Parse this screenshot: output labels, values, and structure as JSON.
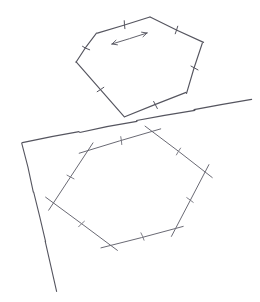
{
  "figure": {
    "title": "Hand-drawn geometry sketch",
    "background_color": "#ffffff",
    "ink_color": "#55555f",
    "ink_color_light": "#7a7a85",
    "canvas": {
      "width": 260,
      "height": 302
    }
  },
  "shapes": {
    "upper_hexagon": {
      "name": "upper-hexagon",
      "label": "",
      "stroke": "#55555f",
      "vertices": [
        [
          97,
          33
        ],
        [
          150,
          17
        ],
        [
          203,
          43
        ],
        [
          186,
          93
        ],
        [
          125,
          117
        ],
        [
          76,
          62
        ]
      ],
      "tick_marks": [
        {
          "edge_index": 0,
          "t": 0.52,
          "length": 8,
          "angle_offset": 12
        },
        {
          "edge_index": 1,
          "t": 0.5,
          "length": 8,
          "angle_offset": -8
        },
        {
          "edge_index": 2,
          "t": 0.5,
          "length": 8,
          "angle_offset": 10
        },
        {
          "edge_index": 3,
          "t": 0.5,
          "length": 8,
          "angle_offset": -6
        },
        {
          "edge_index": 4,
          "t": 0.5,
          "length": 8,
          "angle_offset": 8
        },
        {
          "edge_index": 5,
          "t": 0.48,
          "length": 8,
          "angle_offset": -10
        }
      ]
    },
    "lower_hexagon": {
      "name": "lower-hexagon",
      "label": "",
      "stroke": "#6a6a74",
      "overshoot": 9,
      "vertices": [
        [
          88,
          151
        ],
        [
          152,
          131
        ],
        [
          205,
          172
        ],
        [
          175,
          228
        ],
        [
          110,
          245
        ],
        [
          53,
          203
        ]
      ],
      "tick_marks": [
        {
          "edge_index": 0,
          "t": 0.52,
          "length": 8,
          "angle_offset": 10
        },
        {
          "edge_index": 1,
          "t": 0.5,
          "length": 8,
          "angle_offset": -6
        },
        {
          "edge_index": 2,
          "t": 0.5,
          "length": 8,
          "angle_offset": 8
        },
        {
          "edge_index": 3,
          "t": 0.5,
          "length": 8,
          "angle_offset": -8
        },
        {
          "edge_index": 4,
          "t": 0.5,
          "length": 8,
          "angle_offset": 10
        },
        {
          "edge_index": 5,
          "t": 0.5,
          "length": 8,
          "angle_offset": -6
        }
      ]
    }
  },
  "guide_lines": [
    {
      "name": "tangent-line",
      "points": [
        [
          252,
          99
        ],
        [
          22,
          143
        ]
      ],
      "stroke": "#4e4e58",
      "width": 1.2
    },
    {
      "name": "left-ray",
      "points": [
        [
          22,
          143
        ],
        [
          57,
          291
        ]
      ],
      "stroke": "#6f6f79",
      "width": 1.1
    }
  ],
  "annotations": {
    "translation_arrow": {
      "name": "translation-arrow",
      "label": "",
      "from": [
        112,
        44
      ],
      "to": [
        147,
        33
      ],
      "double_headed": true,
      "head_length": 5.5,
      "head_angle_deg": 26,
      "stroke": "#5a5a64"
    }
  }
}
